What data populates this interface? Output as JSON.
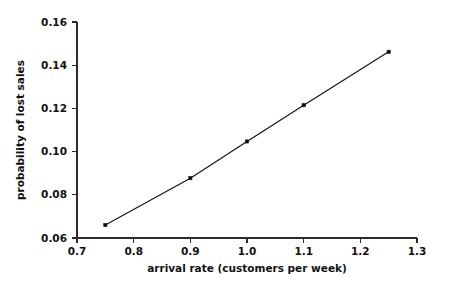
{
  "chart_data": {
    "type": "line",
    "title": "",
    "xlabel": "arrival rate (customers per week)",
    "ylabel": "probability of lost sales",
    "xlim": [
      0.7,
      1.3
    ],
    "ylim": [
      0.06,
      0.16
    ],
    "grid": false,
    "legend": null,
    "xticks": [
      0.7,
      0.8,
      0.9,
      1.0,
      1.1,
      1.2,
      1.3
    ],
    "xtick_labels": [
      "0.7",
      "0.8",
      "0.9",
      "1.0",
      "1.1",
      "1.2",
      "1.3"
    ],
    "yticks": [
      0.06,
      0.08,
      0.1,
      0.12,
      0.14,
      0.16
    ],
    "ytick_labels": [
      "0.06",
      "0.08",
      "0.10",
      "0.12",
      "0.14",
      "0.16"
    ],
    "marker": "square",
    "x": [
      0.75,
      0.9,
      1.0,
      1.1,
      1.25
    ],
    "values": [
      0.066,
      0.0877,
      0.1047,
      0.1215,
      0.1462
    ],
    "series": [
      {
        "name": "probability of lost sales",
        "x": [
          0.75,
          0.9,
          1.0,
          1.1,
          1.25
        ],
        "values": [
          0.066,
          0.0877,
          0.1047,
          0.1215,
          0.1462
        ]
      }
    ],
    "colors": {
      "line": "#141414",
      "marker": "#0d0d0d",
      "axis": "#2b2b2b",
      "text": "#111111",
      "background": "#ffffff"
    }
  },
  "axes": {
    "x_title": "arrival rate (customers per week)",
    "y_title": "probability of lost sales",
    "x_tick_0": "0.7",
    "x_tick_1": "0.8",
    "x_tick_2": "0.9",
    "x_tick_3": "1.0",
    "x_tick_4": "1.1",
    "x_tick_5": "1.2",
    "x_tick_6": "1.3",
    "y_tick_0": "0.06",
    "y_tick_1": "0.08",
    "y_tick_2": "0.10",
    "y_tick_3": "0.12",
    "y_tick_4": "0.14",
    "y_tick_5": "0.16"
  }
}
